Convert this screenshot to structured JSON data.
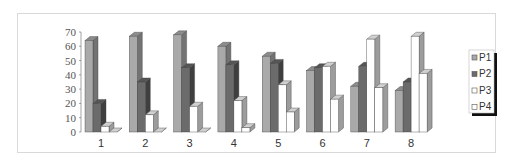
{
  "chart_data": {
    "type": "bar",
    "subtype": "3d-clustered-column",
    "title": "",
    "xlabel": "",
    "ylabel": "",
    "categories": [
      "1",
      "2",
      "3",
      "4",
      "5",
      "6",
      "7",
      "8"
    ],
    "series": [
      {
        "name": "P1",
        "values": [
          64,
          67,
          68,
          60,
          53,
          43,
          32,
          29
        ]
      },
      {
        "name": "P2",
        "values": [
          20,
          35,
          45,
          47,
          48,
          45,
          46,
          35
        ]
      },
      {
        "name": "P3",
        "values": [
          4,
          12,
          18,
          22,
          33,
          46,
          65,
          67
        ]
      },
      {
        "name": "P4",
        "values": [
          0,
          0,
          0,
          3,
          14,
          23,
          31,
          41
        ]
      }
    ],
    "ylim": [
      0,
      70
    ],
    "yticks": [
      0,
      10,
      20,
      30,
      40,
      50,
      60,
      70
    ],
    "grid": false,
    "legend_position": "right"
  },
  "style": {
    "series_colors": {
      "P1": {
        "front": "#a9a9a9",
        "side": "#737373",
        "top": "#8c8c8c"
      },
      "P2": {
        "front": "#6b6b6b",
        "side": "#3f3f3f",
        "top": "#555555"
      },
      "P3": {
        "front": "#ffffff",
        "side": "#9c9c9c",
        "top": "#d0d0d0"
      },
      "P4": {
        "front": "#ffffff",
        "side": "#9c9c9c",
        "top": "#d0d0d0"
      }
    },
    "frame_border": "#d9d9d9",
    "axis_color": "#666666"
  },
  "legend": {
    "items": [
      {
        "label": "P1"
      },
      {
        "label": "P2"
      },
      {
        "label": "P3"
      },
      {
        "label": "P4"
      }
    ]
  }
}
